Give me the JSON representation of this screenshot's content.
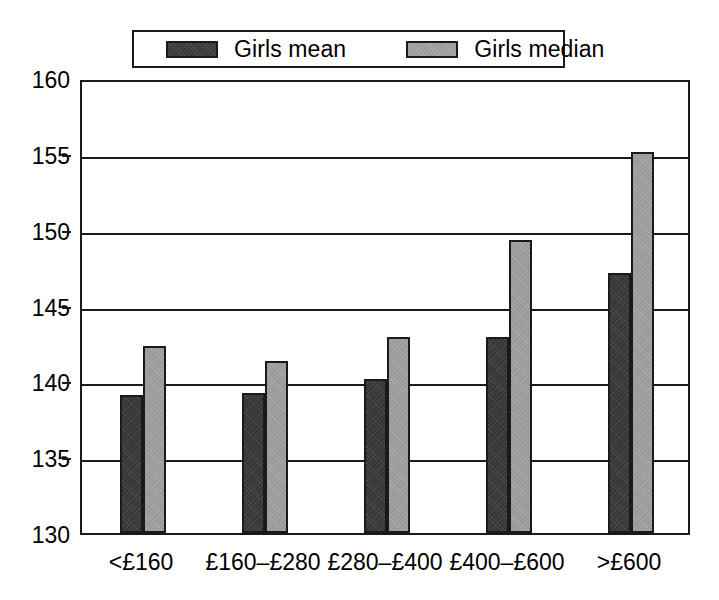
{
  "chart_data": {
    "type": "bar",
    "title": "",
    "xlabel": "",
    "ylabel": "",
    "ylim": [
      130,
      160
    ],
    "yticks": [
      130,
      135,
      140,
      145,
      150,
      155,
      160
    ],
    "ytick_labels": [
      "130",
      "135",
      "140",
      "145",
      "150",
      "155",
      "160"
    ],
    "grid": true,
    "legend_position": "top",
    "categories": [
      "<£160",
      "£160–£280",
      "£280–£400",
      "£400–£600",
      ">£600"
    ],
    "series": [
      {
        "name": "Girls mean",
        "color": "#343434",
        "values": [
          139.0,
          139.1,
          140.0,
          142.8,
          147.0
        ]
      },
      {
        "name": "Girls median",
        "color": "#9b9b9b",
        "values": [
          142.2,
          141.2,
          142.8,
          149.2,
          155.0
        ]
      }
    ]
  },
  "legend": {
    "entries": [
      {
        "label": "Girls mean",
        "swatch": "dark-swatch-icon"
      },
      {
        "label": "Girls median",
        "swatch": "light-swatch-icon"
      }
    ]
  }
}
